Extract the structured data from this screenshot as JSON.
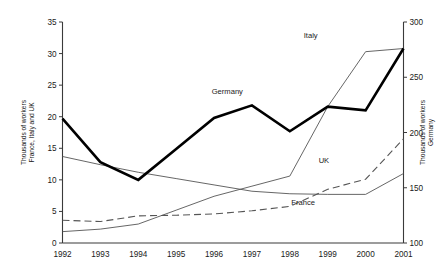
{
  "chart_data": {
    "type": "line",
    "title": "",
    "xlabel": "",
    "categories": [
      1992,
      1993,
      1994,
      1995,
      1996,
      1997,
      1998,
      1999,
      2000,
      2001
    ],
    "tick_labels_x": [
      "1992",
      "1993",
      "1994",
      "1995",
      "1996",
      "1997",
      "1998",
      "1999",
      "2000",
      "2001"
    ],
    "grid": false,
    "legend_position": "inline-labels",
    "axes": {
      "left": {
        "label_line1": "Thousands of workers",
        "label_line2": "France, Italy and UK",
        "min": 0,
        "max": 35,
        "step": 5,
        "ticks": [
          0,
          5,
          10,
          15,
          20,
          25,
          30,
          35
        ],
        "tick_labels": [
          "0",
          "5",
          "10",
          "15",
          "20",
          "25",
          "30",
          "35"
        ],
        "series": [
          "France",
          "Italy",
          "UK"
        ]
      },
      "right": {
        "label_line1": "Thousands of workers",
        "label_line2": "Germany",
        "min": 100,
        "max": 300,
        "step": 50,
        "ticks": [
          100,
          150,
          200,
          250,
          300
        ],
        "tick_labels": [
          "100",
          "150",
          "200",
          "250",
          "300"
        ],
        "series": [
          "Germany"
        ]
      }
    },
    "series": [
      {
        "name": "Germany",
        "axis": "right",
        "style": "solid-thick",
        "color": "#000000",
        "label_x": 1996.35,
        "label_y_left_equiv": 23.6,
        "values_right_axis": [
          212,
          173,
          157,
          185,
          213,
          224,
          201,
          223,
          220,
          276
        ],
        "values_left_equiv": [
          19.7,
          12.8,
          10.0,
          14.9,
          19.8,
          21.8,
          17.7,
          21.6,
          21.0,
          30.8
        ]
      },
      {
        "name": "Italy",
        "axis": "left",
        "style": "solid-thin",
        "color": "#555555",
        "label_x": 1998.55,
        "label_y": 32.4,
        "values": [
          1.8,
          2.2,
          3.0,
          5.2,
          7.4,
          9.0,
          10.6,
          21.6,
          30.3,
          30.8
        ]
      },
      {
        "name": "UK",
        "axis": "left",
        "style": "dashed",
        "color": "#555555",
        "label_x": 1998.9,
        "label_y": 12.6,
        "values": [
          3.6,
          3.4,
          4.3,
          4.4,
          4.6,
          5.1,
          5.8,
          8.5,
          10.1,
          16.5
        ]
      },
      {
        "name": "France",
        "axis": "left",
        "style": "solid-thin",
        "color": "#555555",
        "label_x": 1998.35,
        "label_y": 6.0,
        "values": [
          13.7,
          12.4,
          11.2,
          10.2,
          9.2,
          8.2,
          7.8,
          7.7,
          7.7,
          11.0
        ]
      }
    ]
  }
}
